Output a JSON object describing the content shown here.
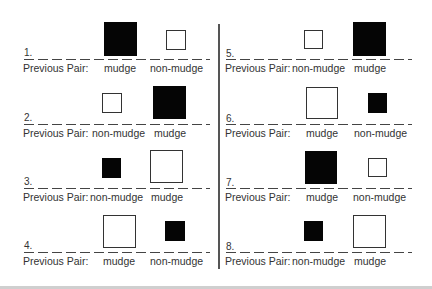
{
  "prev_label": "Previous Pair:",
  "trials": [
    {
      "num": "1.",
      "left": {
        "label": "mudge",
        "fill": "black",
        "size": "large"
      },
      "right": {
        "label": "non-mudge",
        "fill": "white",
        "size": "small"
      }
    },
    {
      "num": "2.",
      "left": {
        "label": "non-mudge",
        "fill": "white",
        "size": "small"
      },
      "right": {
        "label": "mudge",
        "fill": "black",
        "size": "large"
      }
    },
    {
      "num": "3.",
      "left": {
        "label": "non-mudge",
        "fill": "black",
        "size": "small"
      },
      "right": {
        "label": "mudge",
        "fill": "white",
        "size": "large"
      }
    },
    {
      "num": "4.",
      "left": {
        "label": "mudge",
        "fill": "white",
        "size": "large"
      },
      "right": {
        "label": "non-mudge",
        "fill": "black",
        "size": "small"
      }
    },
    {
      "num": "5.",
      "left": {
        "label": "non-mudge",
        "fill": "white",
        "size": "small"
      },
      "right": {
        "label": "mudge",
        "fill": "black",
        "size": "large"
      }
    },
    {
      "num": "6.",
      "left": {
        "label": "mudge",
        "fill": "white",
        "size": "large"
      },
      "right": {
        "label": "non-mudge",
        "fill": "black",
        "size": "small"
      }
    },
    {
      "num": "7.",
      "left": {
        "label": "mudge",
        "fill": "black",
        "size": "large"
      },
      "right": {
        "label": "non-mudge",
        "fill": "white",
        "size": "small"
      }
    },
    {
      "num": "8.",
      "left": {
        "label": "non-mudge",
        "fill": "black",
        "size": "small"
      },
      "right": {
        "label": "mudge",
        "fill": "white",
        "size": "large"
      }
    }
  ]
}
